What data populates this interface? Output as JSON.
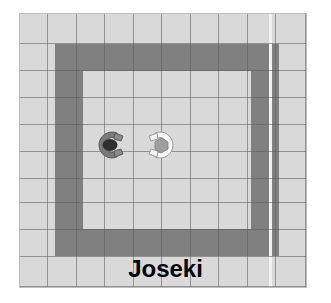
{
  "scene": {
    "label": "Joseki",
    "width": 331,
    "height": 303,
    "background_color": "#ffffff"
  },
  "board": {
    "name": "grid-arena",
    "columns": 10,
    "rows": 10,
    "cell_size_px": 28,
    "floor_color": "#d9d9d9",
    "wall_color": "#808080",
    "gridline_color": "#5a5a5a",
    "highlight_line_color": "#f2f2f2",
    "origin_x_px": 19,
    "origin_y_px": 13,
    "width_px": 288,
    "height_px": 275,
    "wall_shape": "rectangular-ring",
    "wall_ring": {
      "left_col": 1,
      "top_row": 1,
      "right_col": 8,
      "bottom_row": 8,
      "thickness_cells": 1
    }
  },
  "agents": [
    {
      "name": "robot-dark",
      "color": "#3c3c3c",
      "body_color": "#6e6e6e",
      "facing": "right",
      "x_px": 112,
      "y_px": 145,
      "cell_col": 3,
      "cell_row": 4
    },
    {
      "name": "robot-light",
      "color": "#f5f5f5",
      "body_color": "#a8a8a8",
      "facing": "left",
      "x_px": 160,
      "y_px": 145,
      "cell_col": 5,
      "cell_row": 4
    }
  ],
  "gridlines": {
    "vertical_x": [
      0,
      28,
      57,
      85,
      114,
      142,
      171,
      199,
      228,
      256,
      287
    ],
    "horizontal_y": [
      0,
      31,
      58,
      85,
      112,
      139,
      166,
      189,
      216,
      243,
      274
    ],
    "highlight_vertical_x": 251
  }
}
